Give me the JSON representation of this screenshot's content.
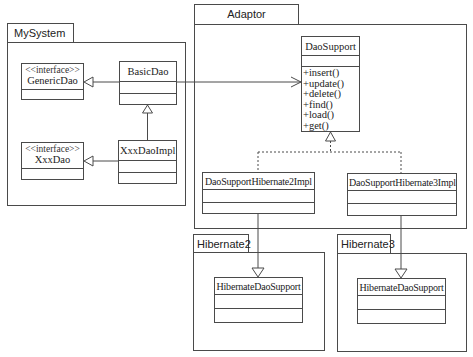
{
  "packages": {
    "mysystem": {
      "label": "MySystem"
    },
    "adaptor": {
      "label": "Adaptor"
    },
    "hibernate2": {
      "label": "Hibernate2"
    },
    "hibernate3": {
      "label": "Hibernate3"
    }
  },
  "classes": {
    "generic_dao": {
      "stereotype": "<<interface>>",
      "name": "GenericDao"
    },
    "basic_dao": {
      "name": "BasicDao"
    },
    "xxx_dao": {
      "stereotype": "<<interface>>",
      "name": "XxxDao"
    },
    "xxx_dao_impl": {
      "name": "XxxDaoImpl"
    },
    "dao_support": {
      "name": "DaoSupport",
      "operations": [
        "+insert()",
        "+update()",
        "+delete()",
        "+find()",
        "+load()",
        "+get()"
      ]
    },
    "dao_support_h2": {
      "name": "DaoSupportHibernate2Impl"
    },
    "dao_support_h3": {
      "name": "DaoSupportHibernate3Impl"
    },
    "hibernate_dao_support_2": {
      "name": "HibernateDaoSupport"
    },
    "hibernate_dao_support_3": {
      "name": "HibernateDaoSupport"
    }
  },
  "relations": [
    {
      "from": "BasicDao",
      "to": "GenericDao",
      "type": "generalization"
    },
    {
      "from": "XxxDaoImpl",
      "to": "BasicDao",
      "type": "generalization"
    },
    {
      "from": "XxxDaoImpl",
      "to": "XxxDao",
      "type": "generalization"
    },
    {
      "from": "BasicDao",
      "to": "DaoSupport",
      "type": "association"
    },
    {
      "from": "DaoSupportHibernate2Impl",
      "to": "DaoSupport",
      "type": "realization"
    },
    {
      "from": "DaoSupportHibernate3Impl",
      "to": "DaoSupport",
      "type": "realization"
    },
    {
      "from": "DaoSupportHibernate2Impl",
      "to": "HibernateDaoSupport (Hibernate2)",
      "type": "generalization"
    },
    {
      "from": "DaoSupportHibernate3Impl",
      "to": "HibernateDaoSupport (Hibernate3)",
      "type": "generalization"
    }
  ],
  "colors": {
    "line": "#4a4a4a",
    "text": "#222222",
    "background": "#ffffff"
  }
}
